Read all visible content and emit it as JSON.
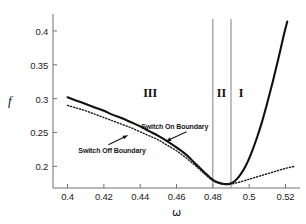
{
  "chart_data": {
    "type": "line",
    "title": "",
    "xlabel": "ω",
    "ylabel": "f",
    "xlim": [
      0.392,
      0.528
    ],
    "ylim": [
      0.168,
      0.425
    ],
    "grid": false,
    "legend_position": "none",
    "xticks": [
      0.4,
      0.42,
      0.44,
      0.46,
      0.48,
      0.5,
      0.52
    ],
    "xtick_labels": [
      "0.4",
      "0.42",
      "0.44",
      "0.46",
      "0.48",
      "0.5",
      "0.52"
    ],
    "yticks": [
      0.2,
      0.25,
      0.3,
      0.35,
      0.4
    ],
    "ytick_labels": [
      "0.2",
      "0.25",
      "0.3",
      "0.35",
      "0.4"
    ],
    "series": [
      {
        "name": "Switch On Boundary",
        "style": "solid",
        "color": "#111111",
        "x": [
          0.4,
          0.405,
          0.41,
          0.415,
          0.42,
          0.425,
          0.43,
          0.435,
          0.44,
          0.445,
          0.45,
          0.455,
          0.46,
          0.465,
          0.47,
          0.475,
          0.48,
          0.483,
          0.486,
          0.489,
          0.492,
          0.495,
          0.498,
          0.501,
          0.504,
          0.507,
          0.51,
          0.513,
          0.516,
          0.519,
          0.521
        ],
        "y": [
          0.302,
          0.297,
          0.292,
          0.287,
          0.282,
          0.276,
          0.271,
          0.265,
          0.259,
          0.252,
          0.245,
          0.237,
          0.228,
          0.218,
          0.205,
          0.192,
          0.18,
          0.176,
          0.174,
          0.174,
          0.178,
          0.187,
          0.2,
          0.218,
          0.24,
          0.265,
          0.294,
          0.325,
          0.358,
          0.393,
          0.414
        ]
      },
      {
        "name": "Switch Off Boundary",
        "style": "dotted",
        "color": "#1c1c1c",
        "x": [
          0.4,
          0.405,
          0.41,
          0.415,
          0.42,
          0.425,
          0.43,
          0.435,
          0.44,
          0.445,
          0.45,
          0.455,
          0.46,
          0.465,
          0.47,
          0.475,
          0.48,
          0.485,
          0.49,
          0.495,
          0.5,
          0.505,
          0.51,
          0.515,
          0.52,
          0.525
        ],
        "y": [
          0.29,
          0.286,
          0.282,
          0.277,
          0.272,
          0.267,
          0.262,
          0.257,
          0.251,
          0.245,
          0.239,
          0.231,
          0.223,
          0.213,
          0.202,
          0.19,
          0.179,
          0.174,
          0.174,
          0.177,
          0.181,
          0.185,
          0.189,
          0.193,
          0.197,
          0.2
        ]
      }
    ],
    "vertical_lines": [
      {
        "name": "boundary-line-left",
        "x": 0.48,
        "color": "#8c8c8c"
      },
      {
        "name": "boundary-line-right",
        "x": 0.49,
        "color": "#8c8c8c"
      }
    ],
    "region_labels": [
      {
        "name": "region-iii",
        "text": "III",
        "x": 0.4455,
        "y": 0.309
      },
      {
        "name": "region-ii",
        "text": "II",
        "x": 0.4848,
        "y": 0.309
      },
      {
        "name": "region-i",
        "text": "I",
        "x": 0.4955,
        "y": 0.309
      }
    ],
    "annotations": [
      {
        "name": "switch-on-annotation",
        "text": "Switch On Boundary",
        "label_x": 0.459,
        "label_y": 0.2595,
        "arrow_from_x": 0.4655,
        "arrow_from_y": 0.251,
        "arrow_to_x": 0.4545,
        "arrow_to_y": 0.2375
      },
      {
        "name": "switch-off-annotation",
        "text": "Switch Off Boundary",
        "label_x": 0.4245,
        "label_y": 0.2245,
        "arrow_from_x": 0.4225,
        "arrow_from_y": 0.232,
        "arrow_to_x": 0.433,
        "arrow_to_y": 0.2455
      }
    ]
  }
}
